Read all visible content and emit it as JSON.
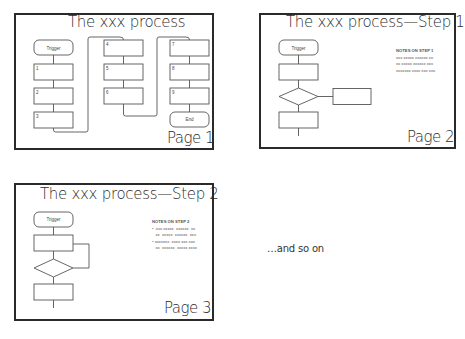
{
  "pages": [
    {
      "title": "The xxx process",
      "page_label": "Page 1",
      "nodes": [
        "Trigger",
        "1",
        "2",
        "3",
        "4",
        "5",
        "6",
        "7",
        "8",
        "9",
        "End"
      ]
    },
    {
      "title": "The xxx process—Step 1",
      "page_label": "Page 2",
      "nodes": [
        "Trigger"
      ],
      "notes": {
        "heading": "NOTES ON STEP 1",
        "lines": [
          "xxx xxxxx  xxxxxx  xx",
          "xx  xxxxx  xxxxxx  xxx",
          "xxxxxxx  xxxx xxx xxx"
        ]
      }
    },
    {
      "title": "The xxx process—Step 2",
      "page_label": "Page 3",
      "nodes": [
        "Trigger"
      ],
      "notes": {
        "heading": "NOTES ON STEP 2",
        "lines": [
          "•  xxx xxxxx  xxxxxx  xx",
          "   xx  xxxxx  xxxxxx  xxx",
          "• xxxxxxx  xxxx xxx xxx",
          "   xx  xxxxxx  xxxxx xxxx"
        ]
      }
    }
  ],
  "footer_text": "…and so on"
}
